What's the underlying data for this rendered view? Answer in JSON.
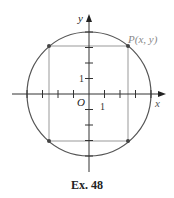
{
  "figure": {
    "axes": {
      "x_label": "x",
      "y_label": "y",
      "origin_label": "O",
      "x_tick_label": "1",
      "y_tick_label": "1"
    },
    "point_label": "P(x, y)",
    "shapes": {
      "circle": "circle centered at origin",
      "rectangle": "rectangle inscribed in circle with corners on circle"
    },
    "colors": {
      "circle": "#555555",
      "rectangle": "#999999",
      "axes": "#333333",
      "point": "#444444",
      "point_label": "#888888"
    }
  },
  "caption": "Ex. 48"
}
